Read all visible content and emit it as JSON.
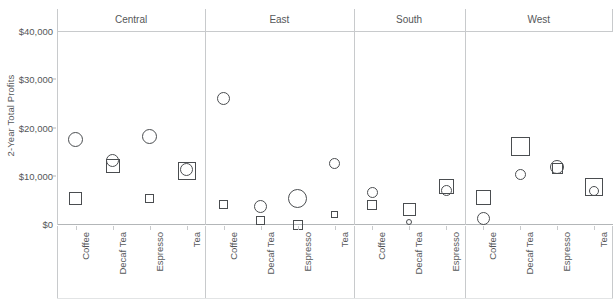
{
  "chart_data": {
    "type": "scatter",
    "title": "",
    "subtitle": "",
    "xlabel": "",
    "ylabel": "2-Year Total Profits",
    "ylim": [
      -2000,
      41000
    ],
    "ytick_values": [
      0,
      10000,
      20000,
      30000,
      40000
    ],
    "ytick_labels": [
      "$0",
      "$10,000",
      "$20,000",
      "$30,000",
      "$40,000"
    ],
    "grid": false,
    "legend_position": "none",
    "panel_variable": "Region",
    "category_variable": "Product",
    "series": [
      {
        "name": "circle-measure",
        "marker": "circle"
      },
      {
        "name": "square-measure",
        "marker": "square"
      }
    ],
    "panels": [
      {
        "label": "Central",
        "categories": [
          "Coffee",
          "Decaf Tea",
          "Espresso",
          "Tea"
        ],
        "points": [
          {
            "category": "Coffee",
            "circle_value": 17600,
            "circle_size": 15,
            "square_value": 5200,
            "square_size": 13
          },
          {
            "category": "Decaf Tea",
            "circle_value": 13200,
            "circle_size": 13,
            "square_value": 12000,
            "square_size": 14
          },
          {
            "category": "Espresso",
            "circle_value": 18100,
            "circle_size": 15,
            "square_value": 5200,
            "square_size": 9
          },
          {
            "category": "Tea",
            "circle_value": 11200,
            "circle_size": 13,
            "square_value": 11000,
            "square_size": 18
          }
        ]
      },
      {
        "label": "East",
        "categories": [
          "Coffee",
          "Decaf Tea",
          "Espresso",
          "Tea"
        ],
        "points": [
          {
            "category": "Coffee",
            "circle_value": 26000,
            "circle_size": 13,
            "square_value": 4000,
            "square_size": 9
          },
          {
            "category": "Decaf Tea",
            "circle_value": 3600,
            "circle_size": 13,
            "square_value": 800,
            "square_size": 9
          },
          {
            "category": "Espresso",
            "circle_value": 5200,
            "circle_size": 19,
            "square_value": -300,
            "square_size": 10
          },
          {
            "category": "Tea",
            "circle_value": 12500,
            "circle_size": 11,
            "square_value": 1900,
            "square_size": 7
          }
        ]
      },
      {
        "label": "South",
        "categories": [
          "Coffee",
          "Decaf Tea",
          "Espresso"
        ],
        "points": [
          {
            "category": "Coffee",
            "circle_value": 6600,
            "circle_size": 11,
            "square_value": 4000,
            "square_size": 10
          },
          {
            "category": "Decaf Tea",
            "circle_value": 400,
            "circle_size": 6,
            "square_value": 3100,
            "square_size": 13
          },
          {
            "category": "Espresso",
            "circle_value": 7000,
            "circle_size": 11,
            "square_value": 7800,
            "square_size": 15
          }
        ]
      },
      {
        "label": "West",
        "categories": [
          "Coffee",
          "Decaf Tea",
          "Espresso",
          "Tea"
        ],
        "points": [
          {
            "category": "Coffee",
            "circle_value": 1200,
            "circle_size": 13,
            "square_value": 5500,
            "square_size": 15
          },
          {
            "category": "Decaf Tea",
            "circle_value": 10200,
            "circle_size": 11,
            "square_value": 16000,
            "square_size": 19
          },
          {
            "category": "Espresso",
            "circle_value": 11900,
            "circle_size": 14,
            "square_value": 11500,
            "square_size": 11
          },
          {
            "category": "Tea",
            "circle_value": 6800,
            "circle_size": 10,
            "square_value": 7600,
            "square_size": 18
          }
        ]
      }
    ]
  },
  "colors": {
    "marker_stroke": "#4a4d50",
    "axis_line": "#b3b6b8",
    "panel_divider": "#c8cacc",
    "text": "#555759",
    "background": "#ffffff"
  }
}
